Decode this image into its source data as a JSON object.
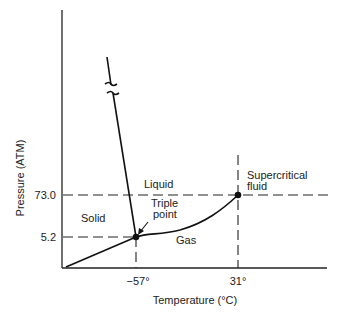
{
  "axes": {
    "xlabel": "Temperature (°C)",
    "ylabel": "Pressure (ATM)",
    "x_ticks": [
      "−57°",
      "31°"
    ],
    "y_ticks": [
      "73.0",
      "5.2"
    ]
  },
  "regions": {
    "solid": "Solid",
    "liquid": "Liquid",
    "gas": "Gas",
    "supercritical_line1": "Supercritical",
    "supercritical_line2": "fluid"
  },
  "points": {
    "triple_line1": "Triple",
    "triple_line2": "point",
    "triple": {
      "temperature_c": -57,
      "pressure_atm": 5.2
    },
    "critical": {
      "temperature_c": 31,
      "pressure_atm": 73.0
    }
  },
  "colors": {
    "ink": "#222222",
    "background": "#ffffff"
  }
}
